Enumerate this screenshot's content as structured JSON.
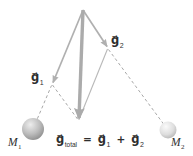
{
  "diagram": {
    "labels": {
      "g1": {
        "base": "g⃗",
        "sub": "1"
      },
      "g2": {
        "base": "g⃗",
        "sub": "2"
      },
      "m1": {
        "base": "M",
        "sub": "1"
      },
      "m2": {
        "base": "M",
        "sub": "2"
      }
    },
    "equation": {
      "lhs": {
        "base": "g⃗",
        "sub": "total"
      },
      "equals": "=",
      "term1": {
        "base": "g⃗",
        "sub": "1"
      },
      "plus": "+",
      "term2": {
        "base": "g⃗",
        "sub": "2"
      }
    },
    "colors": {
      "vector": "#b0b0b0",
      "vector_thick": "#ababab",
      "dashed_line": "#a8a8a8",
      "thin_line": "#b8b8b8",
      "text": "#2e2e2e",
      "sphere1_highlight": "#ededed",
      "sphere1_mid": "#bdbdbd",
      "sphere1_edge": "#898989",
      "sphere2_highlight": "#fafafa",
      "sphere2_mid": "#dedede",
      "sphere2_edge": "#b2b2b2",
      "background": "#ffffff"
    }
  }
}
